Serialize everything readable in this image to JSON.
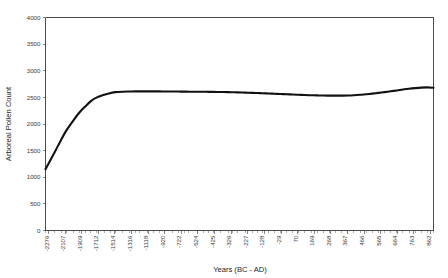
{
  "chart_data": {
    "type": "line",
    "title": "",
    "xlabel": "Years (BC - AD)",
    "ylabel": "Arboreal Pollen Count",
    "ylim": [
      0,
      4000
    ],
    "y_ticks": [
      0,
      500,
      1000,
      1500,
      2000,
      2500,
      3000,
      3500,
      4000
    ],
    "y_tick_labels": [
      "0",
      "500",
      "1000",
      "1500",
      "2000",
      "2500",
      "3000",
      "3500",
      "4000"
    ],
    "grid": false,
    "legend": null,
    "x_tick_labels": [
      "-2276",
      "-2107",
      "-1909",
      "-1712",
      "-1514",
      "-1316",
      "-1118",
      "-920",
      "-722",
      "-524",
      "-425",
      "-326",
      "-227",
      "-128",
      "-29",
      "70",
      "169",
      "268",
      "367",
      "466",
      "565",
      "664",
      "763",
      "862"
    ],
    "x": [
      -2276,
      -2200,
      -2150,
      -2107,
      -2050,
      -2000,
      -1950,
      -1909,
      -1860,
      -1800,
      -1750,
      -1712,
      -1650,
      -1600,
      -1550,
      -1514,
      -1450,
      -1400,
      -1350,
      -1316,
      -1250,
      -1200,
      -1150,
      -1118,
      -1050,
      -1000,
      -960,
      -920,
      -860,
      -800,
      -760,
      -722,
      -660,
      -600,
      -560,
      -524,
      -475,
      -425,
      -375,
      -326,
      -276,
      -227,
      -178,
      -128,
      -78,
      -29,
      20,
      70,
      120,
      169,
      218,
      268,
      318,
      367,
      417,
      466,
      516,
      565,
      615,
      664,
      714,
      763,
      813,
      862
    ],
    "values": [
      1150,
      1480,
      1700,
      1880,
      2070,
      2220,
      2340,
      2430,
      2500,
      2550,
      2580,
      2598,
      2607,
      2610,
      2612,
      2613,
      2613,
      2612,
      2612,
      2611,
      2610,
      2609,
      2608,
      2607,
      2606,
      2605,
      2604,
      2603,
      2601,
      2598,
      2596,
      2593,
      2589,
      2585,
      2581,
      2578,
      2573,
      2568,
      2563,
      2558,
      2553,
      2548,
      2544,
      2540,
      2537,
      2534,
      2533,
      2532,
      2533,
      2535,
      2540,
      2548,
      2558,
      2570,
      2584,
      2599,
      2614,
      2630,
      2647,
      2662,
      2674,
      2683,
      2687,
      2681
    ]
  },
  "axes": {
    "x_title": "Years (BC - AD)",
    "y_title": "Arboreal Pollen Count"
  }
}
